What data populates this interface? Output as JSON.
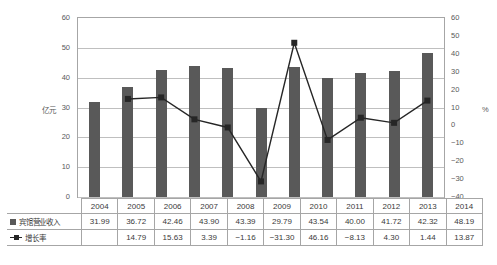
{
  "chart_data": {
    "type": "bar",
    "title": "",
    "xlabel": "",
    "ylabel": "亿元",
    "y2label": "%",
    "categories": [
      "2004",
      "2005",
      "2006",
      "2007",
      "2008",
      "2009",
      "2010",
      "2011",
      "2012",
      "2013",
      "2014"
    ],
    "series": [
      {
        "name": "宾馆营业收入",
        "type": "bar",
        "axis": "left",
        "unit": "亿元",
        "color": "#595959",
        "values": [
          31.99,
          36.72,
          42.46,
          43.9,
          43.39,
          29.79,
          43.54,
          40.0,
          41.72,
          42.32,
          48.19
        ]
      },
      {
        "name": "增长率",
        "type": "line",
        "axis": "right",
        "unit": "%",
        "color": "#262626",
        "values": [
          null,
          14.79,
          15.63,
          3.39,
          -1.16,
          -31.3,
          46.16,
          -8.13,
          4.3,
          1.44,
          13.87
        ]
      }
    ],
    "ylim": [
      0,
      60
    ],
    "yticks": [
      0,
      10,
      20,
      30,
      40,
      50,
      60
    ],
    "ylim2": [
      -40,
      60
    ],
    "yticks2": [
      -40,
      -30,
      -20,
      -10,
      0,
      10,
      20,
      30,
      40,
      50,
      60
    ],
    "grid": true,
    "legend_position": "table-left"
  },
  "axis": {
    "left_ticks": [
      "60",
      "50",
      "40",
      "30",
      "20",
      "10",
      "0"
    ],
    "left_unit": "亿元",
    "right_ticks": [
      "60",
      "50",
      "40",
      "30",
      "20",
      "10",
      "0",
      "-10",
      "-20",
      "-30",
      "-40"
    ],
    "right_unit": "%"
  },
  "table": {
    "years": [
      "2004",
      "2005",
      "2006",
      "2007",
      "2008",
      "2009",
      "2010",
      "2011",
      "2012",
      "2013",
      "2014"
    ],
    "rows": [
      {
        "label": "宾馆营业收入",
        "marker": "bar-swatch",
        "values": [
          "31.99",
          "36.72",
          "42.46",
          "43.90",
          "43.39",
          "29.79",
          "43.54",
          "40.00",
          "41.72",
          "42.32",
          "48.19"
        ]
      },
      {
        "label": "增长率",
        "marker": "line-swatch",
        "values": [
          "",
          "14.79",
          "15.63",
          "3.39",
          "-1.16",
          "-31.30",
          "46.16",
          "-8.13",
          "4.30",
          "1.44",
          "13.87"
        ]
      }
    ]
  }
}
